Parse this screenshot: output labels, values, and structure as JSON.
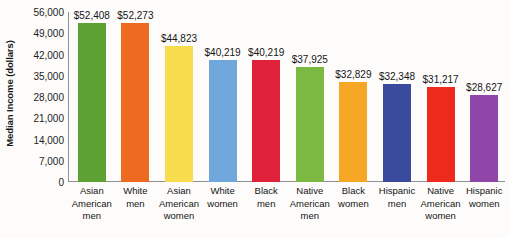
{
  "chart_data": {
    "type": "bar",
    "title": "",
    "xlabel": "",
    "ylabel": "Median Income (dollars)",
    "ylim": [
      0,
      56000
    ],
    "grid": false,
    "legend": "none",
    "ytick_labels": [
      "56,000",
      "49,000",
      "42,000",
      "35,000",
      "28,000",
      "21,000",
      "14,000",
      "7,000",
      "0"
    ],
    "ytick_values": [
      56000,
      49000,
      42000,
      35000,
      28000,
      21000,
      14000,
      7000,
      0
    ],
    "categories": [
      "Asian American men",
      "White men",
      "Asian American women",
      "White women",
      "Black men",
      "Native American men",
      "Black women",
      "Hispanic men",
      "Native American women",
      "Hispanic women"
    ],
    "category_lines": [
      [
        "Asian",
        "American",
        "men"
      ],
      [
        "White",
        "men"
      ],
      [
        "Asian",
        "American",
        "women"
      ],
      [
        "White",
        "women"
      ],
      [
        "Black",
        "men"
      ],
      [
        "Native",
        "American",
        "men"
      ],
      [
        "Black",
        "women"
      ],
      [
        "Hispanic",
        "men"
      ],
      [
        "Native",
        "American",
        "women"
      ],
      [
        "Hispanic",
        "women"
      ]
    ],
    "values": [
      52408,
      52273,
      44823,
      40219,
      40219,
      37925,
      32829,
      32348,
      31217,
      28627
    ],
    "value_labels": [
      "$52,408",
      "$52,273",
      "$44,823",
      "$40,219",
      "$40,219",
      "$37,925",
      "$32,829",
      "$32,348",
      "$31,217",
      "$28,627"
    ],
    "colors": [
      "#5ca132",
      "#ef6a21",
      "#f7dd4e",
      "#6fa7dd",
      "#e0213a",
      "#7cb943",
      "#f6a724",
      "#3a4b9e",
      "#ee2a1c",
      "#8f46a8"
    ]
  }
}
